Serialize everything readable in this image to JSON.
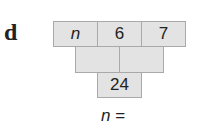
{
  "question": {
    "label": "d",
    "pyramid": {
      "top_row": [
        "n",
        "6",
        "7"
      ],
      "middle_row": [
        "",
        ""
      ],
      "bottom_row": [
        "24"
      ]
    },
    "answer_prompt": "n ="
  }
}
